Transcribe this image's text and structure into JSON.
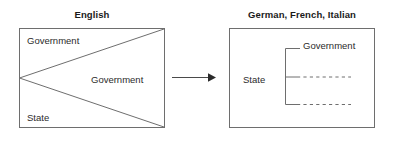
{
  "figure": {
    "type": "conceptual-diagram",
    "background_color": "#ffffff",
    "line_color": "#6e6e6e",
    "text_color": "#2b2b2b"
  },
  "left_panel": {
    "title": "English",
    "labels": {
      "top": "Government",
      "center": "Government",
      "bottom": "State"
    }
  },
  "arrow": {
    "name": "transformation-arrow",
    "direction": "left-to-right"
  },
  "right_panel": {
    "title": "German, French, Italian",
    "labels": {
      "left": "State",
      "branch_top": "Government"
    },
    "branches": [
      {
        "style": "solid",
        "label": "Government"
      },
      {
        "style": "dashed",
        "label": ""
      },
      {
        "style": "dashed",
        "label": ""
      }
    ]
  }
}
